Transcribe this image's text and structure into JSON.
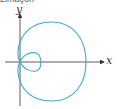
{
  "caption": "Limaçon",
  "axes": {
    "x_label": "x",
    "y_label": "y"
  },
  "colors": {
    "curve": "#3aa9cf",
    "axis": "#333333"
  },
  "curve": {
    "type": "limacon-inner-loop"
  }
}
